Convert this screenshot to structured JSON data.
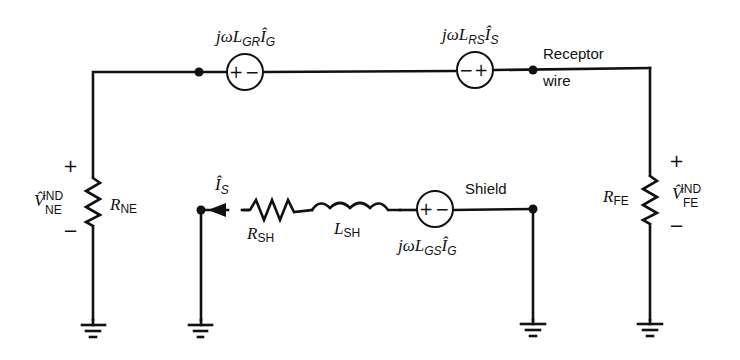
{
  "diagram": {
    "type": "circuit-schematic",
    "labels": {
      "source_gr": {
        "prefix": "jωL",
        "sub": "GR",
        "current": "Î",
        "current_sub": "G",
        "polarity": "+ −"
      },
      "source_rs": {
        "prefix": "jωL",
        "sub": "RS",
        "current": "Î",
        "current_sub": "S",
        "polarity": "− +"
      },
      "source_gs": {
        "prefix": "jωL",
        "sub": "GS",
        "current": "Î",
        "current_sub": "G",
        "polarity": "+ −"
      },
      "receptor_line1": "Receptor",
      "receptor_line2": "wire",
      "shield": "Shield",
      "r_ne": {
        "main": "R",
        "sub": "NE"
      },
      "r_fe": {
        "main": "R",
        "sub": "FE"
      },
      "v_ne": {
        "main": "V̂",
        "sup": "IND",
        "sub": "NE"
      },
      "v_fe": {
        "main": "V̂",
        "sup": "IND",
        "sub": "FE"
      },
      "r_sh": {
        "main": "R",
        "sub": "SH"
      },
      "l_sh": {
        "main": "L",
        "sub": "SH"
      },
      "i_s": {
        "main": "Î",
        "sub": "S"
      },
      "plus": "+",
      "minus": "−"
    }
  }
}
